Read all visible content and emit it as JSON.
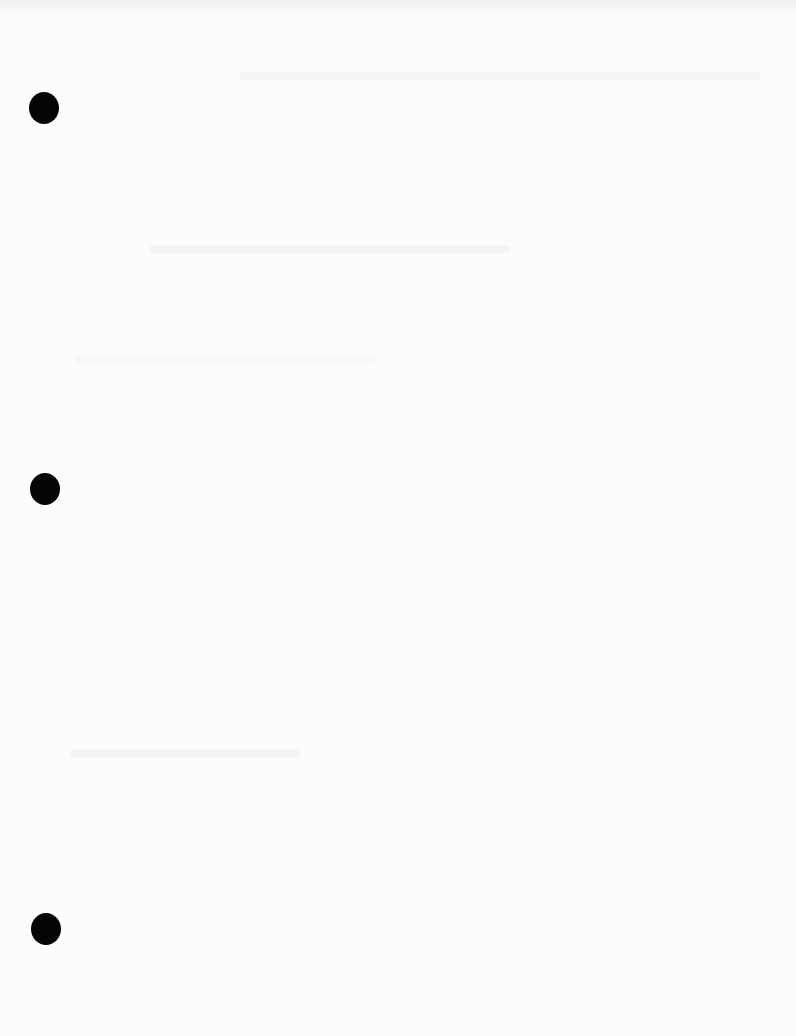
{
  "document": {
    "type": "blank scanned page",
    "content": "",
    "punch_holes": [
      {
        "x": 44,
        "y": 108
      },
      {
        "x": 45,
        "y": 489
      },
      {
        "x": 46,
        "y": 929
      }
    ],
    "colors": {
      "paper": "#fcfcfc",
      "hole": "#050505"
    }
  }
}
